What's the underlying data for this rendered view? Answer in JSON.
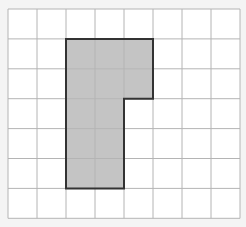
{
  "diagram": {
    "type": "grid-shape",
    "grid": {
      "columns": 8,
      "rows": 7,
      "origin_x": 8,
      "origin_y": 9,
      "cell_w": 29,
      "cell_h": 29.9,
      "background": "#ffffff",
      "line_color": "#b4b4b4"
    },
    "shape": {
      "fill": "#c4c4c4",
      "stroke": "#333333",
      "cells": [
        [
          1,
          2
        ],
        [
          1,
          3
        ],
        [
          1,
          4
        ],
        [
          2,
          2
        ],
        [
          2,
          3
        ],
        [
          2,
          4
        ],
        [
          3,
          2
        ],
        [
          3,
          3
        ],
        [
          4,
          2
        ],
        [
          4,
          3
        ],
        [
          5,
          2
        ],
        [
          5,
          3
        ]
      ],
      "outline_grid_points": [
        [
          2,
          1
        ],
        [
          5,
          1
        ],
        [
          5,
          3
        ],
        [
          4,
          3
        ],
        [
          4,
          6
        ],
        [
          2,
          6
        ]
      ],
      "shaded_cell_count": 12
    }
  }
}
